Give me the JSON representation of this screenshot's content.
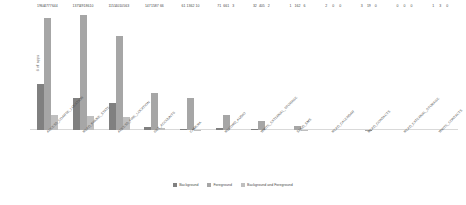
{
  "chart_data": {
    "type": "bar",
    "title": "",
    "xlabel": "",
    "ylabel": "# of apps",
    "ylim": [
      0,
      5200
    ],
    "grid": false,
    "legend_position": "bottom",
    "orientation": "vertical",
    "grouping": "grouped",
    "categories": [
      "ACCESS_COARSE_LOCATION",
      "READ_PHONE_STATE",
      "ACCESS_FINE_LOCATION",
      "GET_ACCOUNTS",
      "CAMERA",
      "RECORD_AUDIO",
      "WRITE_EXTERNAL_STORAGE",
      "SEND_SMS",
      "READ_CALENDAR",
      "READ_CONTACTS",
      "READ_EXTERNAL_STORAGE",
      "WRITE_CONTACTS"
    ],
    "series": [
      {
        "name": "Background",
        "color": "#808080",
        "values": [
          1964,
          1375,
          1151,
          147,
          61,
          71,
          32,
          1,
          2,
          3,
          0,
          1
        ]
      },
      {
        "name": "Foreground",
        "color": "#a6a6a6",
        "values": [
          4777,
          4918,
          4010,
          1587,
          1362,
          661,
          405,
          162,
          0,
          19,
          0,
          3
        ]
      },
      {
        "name": "Background and Foreground",
        "color": "#bfbfbf",
        "values": [
          644,
          610,
          563,
          66,
          10,
          3,
          2,
          6,
          0,
          0,
          0,
          0
        ]
      }
    ],
    "bar_labels": [
      [
        "1964",
        "4777",
        "644"
      ],
      [
        "1375",
        "4918",
        "610"
      ],
      [
        "1151",
        "4010",
        "563"
      ],
      [
        "147",
        "1587",
        "66"
      ],
      [
        "61",
        "1362",
        "10"
      ],
      [
        "71",
        "661",
        "3"
      ],
      [
        "32",
        "405",
        "2"
      ],
      [
        "1",
        "162",
        "6"
      ],
      [
        "2",
        "0",
        "0"
      ],
      [
        "3",
        "19",
        "0"
      ],
      [
        "0",
        "0",
        "0"
      ],
      [
        "1",
        "3",
        "0"
      ]
    ]
  },
  "legend": {
    "items": [
      {
        "label": "Background",
        "color": "#808080"
      },
      {
        "label": "Foreground",
        "color": "#a6a6a6"
      },
      {
        "label": "Background and Foreground",
        "color": "#bfbfbf"
      }
    ]
  },
  "axes": {
    "y_title": "# of apps"
  }
}
